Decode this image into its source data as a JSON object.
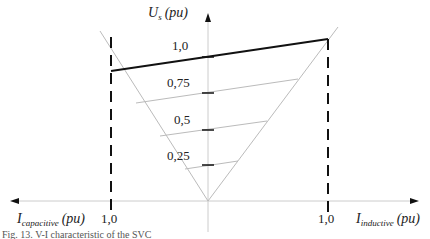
{
  "diagram": {
    "title": "V-I characteristic",
    "y_axis": {
      "label_main": "U",
      "label_sub": "s",
      "label_unit": "(pu)"
    },
    "x_axis": {
      "left_label_main": "I",
      "left_label_sub": "capacitive",
      "left_label_unit": "(pu)",
      "right_label_main": "I",
      "right_label_sub": "inductive",
      "right_label_unit": "(pu)",
      "left_tick": "1,0",
      "right_tick": "1,0"
    },
    "voltage_levels": [
      "1,0",
      "0,75",
      "0,5",
      "0,25"
    ],
    "colors": {
      "characteristic": "#111111",
      "guides": "#bbbbbb",
      "axes": "#cccccc",
      "limits": "#111111"
    }
  },
  "caption": "Fig. 13. V-I characteristic of the SVC"
}
